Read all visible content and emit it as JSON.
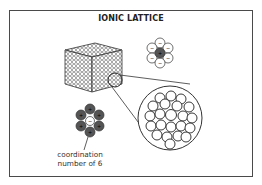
{
  "figure": {
    "title": "IONIC LATTICE",
    "caption_line1": "coordination",
    "caption_line2": "number of 6",
    "colors": {
      "frame": "#4a4a4a",
      "cation_fill": "#555555",
      "anion_fill": "#ffffff",
      "stroke": "#333333"
    },
    "elements": {
      "lattice_cube": "cube of packed spheres",
      "magnified_view": "close-packed circles in zoom lens",
      "top_cluster": {
        "center": "+",
        "surrounding": [
          "-",
          "-",
          "-",
          "-",
          "-",
          "-"
        ]
      },
      "bottom_cluster": {
        "center": "-",
        "surrounding": [
          "+",
          "+",
          "+",
          "+",
          "+",
          "+"
        ]
      }
    }
  }
}
